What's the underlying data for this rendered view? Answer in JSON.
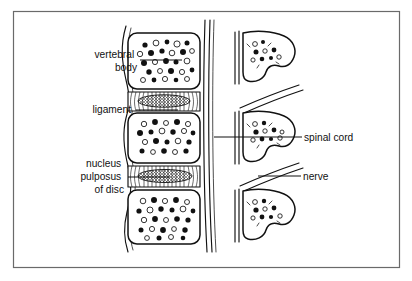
{
  "figure": {
    "type": "medical-line-diagram",
    "background_color": "#ffffff",
    "ink_color": "#111111",
    "frame_color": "#6a6a6a",
    "frame": {
      "x": 13,
      "y": 11,
      "width": 387,
      "height": 257
    }
  },
  "labels": [
    {
      "id": "vertebral-body",
      "lines": [
        "vertebral",
        "body"
      ],
      "text": "vertebral body",
      "align": "right",
      "text_x": 137,
      "text_y": 58,
      "line_height": 13,
      "leader": {
        "x1": 140,
        "y1": 60,
        "x2": 182,
        "y2": 60
      }
    },
    {
      "id": "ligament",
      "lines": [
        "ligament"
      ],
      "text": "ligament",
      "align": "right",
      "text_x": 131,
      "text_y": 113,
      "line_height": 13,
      "leader": {
        "x1": 136,
        "y1": 110,
        "x2": 178,
        "y2": 110
      }
    },
    {
      "id": "nucleus-pulposus-of-disc",
      "lines": [
        "nucleus",
        "pulposus",
        "of disc"
      ],
      "text": "nucleus pulposus of disc",
      "align": "right",
      "text_x": 124,
      "text_y": 167,
      "line_height": 13,
      "leader": {
        "x1": 128,
        "y1": 177,
        "x2": 170,
        "y2": 177
      }
    },
    {
      "id": "spinal-cord",
      "lines": [
        "spinal cord"
      ],
      "text": "spinal cord",
      "align": "left",
      "text_x": 304,
      "text_y": 141,
      "line_height": 13,
      "leader": {
        "x1": 214,
        "y1": 137,
        "x2": 302,
        "y2": 137
      }
    },
    {
      "id": "nerve",
      "lines": [
        "nerve"
      ],
      "text": "nerve",
      "align": "left",
      "text_x": 303,
      "text_y": 180,
      "line_height": 13,
      "leader": {
        "x1": 258,
        "y1": 176,
        "x2": 301,
        "y2": 176
      }
    }
  ],
  "anatomy": {
    "left_column": {
      "name": "lateral view of lumbar vertebral bodies and discs",
      "vertebral_bodies": [
        {
          "id": "vertebral-body-1",
          "x": 128,
          "y": 33,
          "width": 72,
          "height": 56
        },
        {
          "id": "vertebral-body-2",
          "x": 128,
          "y": 113,
          "width": 72,
          "height": 50
        },
        {
          "id": "vertebral-body-3",
          "x": 128,
          "y": 190,
          "width": 72,
          "height": 54
        }
      ],
      "discs": [
        {
          "id": "intervertebral-disc-1",
          "x": 128,
          "y": 92,
          "width": 72,
          "height": 19
        },
        {
          "id": "intervertebral-disc-2",
          "x": 128,
          "y": 166,
          "width": 72,
          "height": 21
        }
      ],
      "anterior_ligament": "wavy vertical line along anterior margin",
      "posterior_canal_wall": "triple vertical line at posterior margin"
    },
    "right_column": {
      "name": "posterior view of laminae with spinal cord and exiting nerve roots",
      "segments": [
        {
          "id": "lamina-1",
          "x": 236,
          "y": 30,
          "width": 72,
          "height": 52
        },
        {
          "id": "lamina-2",
          "x": 236,
          "y": 110,
          "width": 72,
          "height": 52
        },
        {
          "id": "lamina-3",
          "x": 236,
          "y": 186,
          "width": 72,
          "height": 52
        }
      ],
      "canal_wall": "double vertical line on medial side of each lamina",
      "nerve_roots": "paired diagonal lines sweeping superolaterally from each segment"
    }
  }
}
